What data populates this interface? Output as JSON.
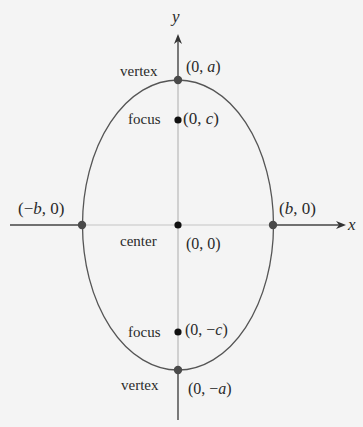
{
  "diagram": {
    "type": "vertical-ellipse",
    "axes": {
      "x_label": "x",
      "y_label": "y"
    },
    "points": {
      "top_vertex": {
        "role": "vertex",
        "coord_prefix": "(0, ",
        "coord_var": "a",
        "coord_suffix": ")"
      },
      "upper_focus": {
        "role": "focus",
        "coord_prefix": "(0, ",
        "coord_var": "c",
        "coord_suffix": ")"
      },
      "center": {
        "role": "center",
        "coord": "(0, 0)"
      },
      "lower_focus": {
        "role": "focus",
        "coord_prefix": "(0, −",
        "coord_var": "c",
        "coord_suffix": ")"
      },
      "bottom_vertex": {
        "role": "vertex",
        "coord_prefix": "(0, −",
        "coord_var": "a",
        "coord_suffix": ")"
      },
      "left_covertex": {
        "coord_prefix": "(−",
        "coord_var": "b",
        "coord_suffix": ", 0)"
      },
      "right_covertex": {
        "coord_prefix": "(",
        "coord_var": "b",
        "coord_suffix": ", 0)"
      }
    },
    "colors": {
      "background": "#f4f4f4",
      "ellipse_stroke": "#555555",
      "axis_outer": "#444444",
      "axis_inner": "#b8b8b8",
      "vertex_dot": "#4a4a4a",
      "focus_dot": "#111111"
    }
  }
}
